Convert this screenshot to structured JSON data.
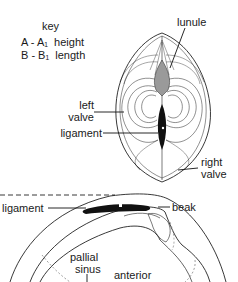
{
  "key": {
    "title": "key",
    "rows": [
      {
        "symbol": "A - A₁",
        "meaning": "height"
      },
      {
        "symbol": "B - B₁",
        "meaning": "length"
      }
    ]
  },
  "top_view": {
    "labels": {
      "lunule": "lunule",
      "left_valve_1": "left",
      "left_valve_2": "valve",
      "ligament": "ligament",
      "right_valve_1": "right",
      "right_valve_2": "valve"
    }
  },
  "side_view": {
    "labels": {
      "ligament": "ligament",
      "beak": "beak",
      "pallial_sinus_1": "pallial",
      "pallial_sinus_2": "sinus",
      "anterior": "anterior"
    }
  }
}
